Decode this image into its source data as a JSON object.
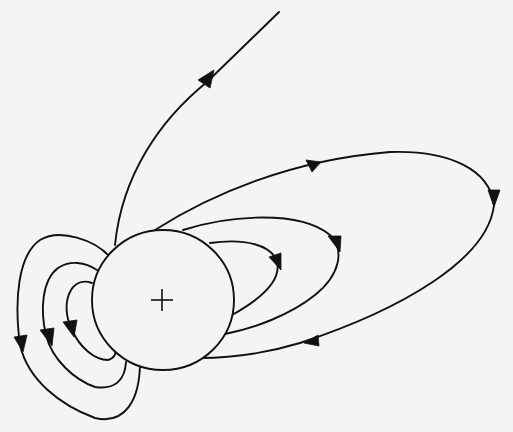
{
  "diagram": {
    "charge_label": "+",
    "colors": {
      "background": "#f4f4f2",
      "ink": "#111111"
    },
    "sphere": {
      "cx": 163,
      "cy": 300,
      "rx": 71,
      "ry": 70
    },
    "field_lines": [
      {
        "id": "escaping-line",
        "arrows": 1,
        "direction": "outward to top-right"
      },
      {
        "id": "large-right-loop",
        "arrows": 3
      },
      {
        "id": "middle-right-loop",
        "arrows": 1
      },
      {
        "id": "inner-right-loop",
        "arrows": 1
      },
      {
        "id": "outer-left-loop",
        "arrows": 1
      },
      {
        "id": "middle-left-loop",
        "arrows": 1
      },
      {
        "id": "inner-left-loop",
        "arrows": 1
      }
    ]
  }
}
